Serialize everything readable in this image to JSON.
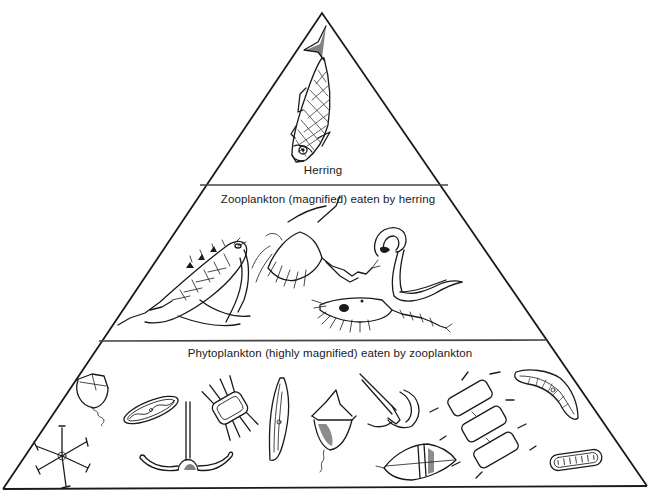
{
  "diagram": {
    "type": "food-pyramid",
    "colors": {
      "ink": "#1a1a1a",
      "background": "#ffffff"
    },
    "levels": [
      {
        "id": "top",
        "label": "Herring",
        "organisms": [
          "herring"
        ]
      },
      {
        "id": "middle",
        "label": "Zooplankton (magnified) eaten by herring",
        "organisms": [
          "copepod",
          "crab-larva",
          "arrow-worm",
          "shrimp-larva"
        ]
      },
      {
        "id": "bottom",
        "label": "Phytoplankton (highly magnified) eaten by zooplankton",
        "organisms": [
          "dinoflagellate-cup",
          "star-diatom",
          "pennate-diatom-oval",
          "anchor-dinoflagellate",
          "square-diatom",
          "crescent-diatom",
          "dinoflagellate-spiky",
          "hook-dinoflagellate",
          "chain-diatom",
          "spindle-dinoflagellate",
          "cymbella-diatom",
          "pennate-diatom-small"
        ]
      }
    ]
  }
}
